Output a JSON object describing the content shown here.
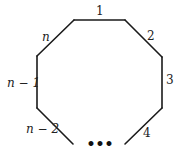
{
  "diagram": {
    "type": "open-polygon",
    "edges": [
      {
        "label": "1",
        "italic": false
      },
      {
        "label": "2",
        "italic": false
      },
      {
        "label": "3",
        "italic": false
      },
      {
        "label": "4",
        "italic": false
      },
      {
        "label": "n",
        "italic": true
      },
      {
        "label": "n − 1",
        "italic": true
      },
      {
        "label": "n − 2",
        "italic": true
      }
    ],
    "ellipsis": "•••",
    "colors": {
      "stroke": "#1a1a1a",
      "text": "#222222",
      "background": "#ffffff"
    }
  }
}
